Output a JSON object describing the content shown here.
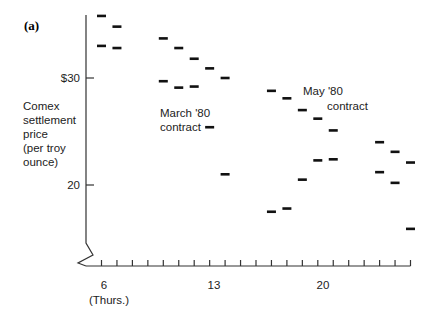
{
  "chart_data": {
    "type": "scatter",
    "panel_label": "(a)",
    "title": "",
    "xlabel": "",
    "ylabel": "Comex settlement price (per troy ounce)",
    "ylabel_lines": [
      "Comex",
      "settlement",
      "price",
      "(per troy",
      "ounce)"
    ],
    "y_ticks": [
      {
        "value": 30,
        "label": "$30"
      },
      {
        "value": 20,
        "label": "20"
      }
    ],
    "x_ticks_labeled": [
      {
        "value": 6,
        "label": "6",
        "sublabel": "(Thurs.)"
      },
      {
        "value": 13,
        "label": "13"
      },
      {
        "value": 20,
        "label": "20"
      }
    ],
    "x_tick_days": [
      6,
      7,
      8,
      9,
      10,
      11,
      12,
      13,
      14,
      15,
      16,
      17,
      18,
      19,
      20,
      21,
      22,
      23,
      24,
      25,
      26
    ],
    "ylim": [
      13,
      36
    ],
    "xlim": [
      5,
      27
    ],
    "axis_break": true,
    "grid": false,
    "legend": "none",
    "annotations": [
      {
        "text_lines": [
          "March '80",
          "contract"
        ],
        "x": 158,
        "y": 119
      },
      {
        "text_lines": [
          "May '80",
          "contract"
        ],
        "x": 303,
        "y": 95
      }
    ],
    "series": [
      {
        "name": "March '80 contract",
        "x": [
          6,
          7,
          10,
          11,
          12,
          13,
          14,
          17,
          18,
          19,
          20,
          21,
          24,
          25,
          26
        ],
        "values": [
          35.8,
          34.8,
          33.7,
          32.8,
          31.8,
          30.9,
          30.0,
          28.8,
          28.1,
          27.0,
          26.2,
          25.1,
          24.0,
          23.1,
          22.1
        ]
      },
      {
        "name": "May '80 contract",
        "x": [
          6,
          7,
          10,
          11,
          12,
          13,
          14,
          17,
          18,
          19,
          20,
          21,
          24,
          25,
          26
        ],
        "values": [
          33.0,
          32.8,
          29.7,
          29.1,
          29.2,
          25.4,
          21.0,
          17.5,
          17.8,
          20.5,
          22.3,
          22.4,
          21.2,
          20.2,
          15.9
        ]
      }
    ]
  }
}
